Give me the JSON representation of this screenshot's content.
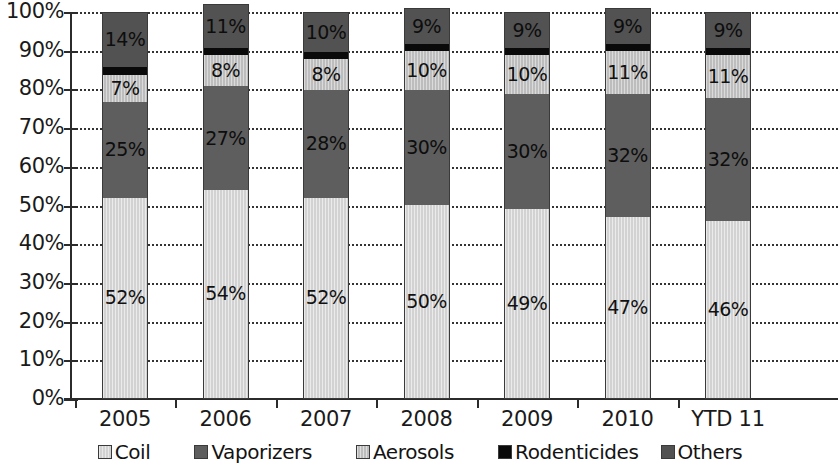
{
  "chart_data": {
    "type": "bar",
    "subtype": "stacked-100-percent",
    "title": "",
    "xlabel": "",
    "ylabel": "",
    "ylim": [
      0,
      100
    ],
    "ytick_labels": [
      "100%",
      "90%",
      "80%",
      "70%",
      "60%",
      "50%",
      "40%",
      "30%",
      "20%",
      "10%",
      "0%"
    ],
    "ytick_values": [
      100,
      90,
      80,
      70,
      60,
      50,
      40,
      30,
      20,
      10,
      0
    ],
    "grid": true,
    "grid_axis": "y",
    "legend_position": "bottom",
    "categories": [
      "2005",
      "2006",
      "2007",
      "2008",
      "2009",
      "2010",
      "YTD 11"
    ],
    "series": [
      {
        "name": "Coil",
        "color": "#d2d2d2",
        "values": [
          52,
          54,
          52,
          50,
          49,
          47,
          46
        ]
      },
      {
        "name": "Vaporizers",
        "color": "#5e5e5e",
        "values": [
          25,
          27,
          28,
          30,
          30,
          32,
          32
        ]
      },
      {
        "name": "Aerosols",
        "color": "#bdbdbd",
        "values": [
          7,
          8,
          8,
          10,
          10,
          11,
          11
        ]
      },
      {
        "name": "Rodenticides",
        "color": "#0a0a0a",
        "values": [
          2,
          2,
          2,
          2,
          2,
          2,
          2
        ]
      },
      {
        "name": "Others",
        "color": "#525252",
        "values": [
          14,
          11,
          10,
          9,
          9,
          9,
          9
        ]
      }
    ],
    "data_labels": {
      "Coil": [
        "52%",
        "54%",
        "52%",
        "50%",
        "49%",
        "47%",
        "46%"
      ],
      "Vaporizers": [
        "25%",
        "27%",
        "28%",
        "30%",
        "30%",
        "32%",
        "32%"
      ],
      "Aerosols": [
        "7%",
        "8%",
        "8%",
        "10%",
        "10%",
        "11%",
        "11%"
      ],
      "Rodenticides": [
        "",
        "",
        "",
        "",
        "",
        "",
        ""
      ],
      "Others": [
        "14%",
        "11%",
        "10%",
        "9%",
        "9%",
        "9%",
        "9%"
      ]
    }
  },
  "legend": {
    "items": [
      {
        "label": "Coil"
      },
      {
        "label": "Vaporizers"
      },
      {
        "label": "Aerosols"
      },
      {
        "label": "Rodenticides"
      },
      {
        "label": "Others"
      }
    ]
  }
}
